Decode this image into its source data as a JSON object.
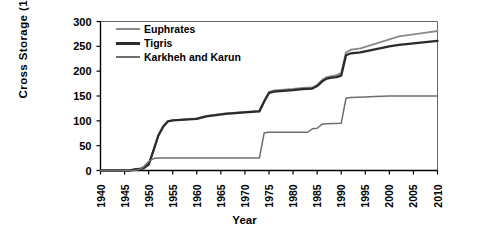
{
  "chart_data": {
    "type": "line",
    "title": "",
    "xlabel": "Year",
    "ylabel": "Cross Storage (10⁹ m³)",
    "ylabel_text": "Cross  Storage  (10",
    "ylabel_exp": "9",
    "ylabel_tail": " m",
    "ylabel_exp2": "3",
    "ylabel_close": ")",
    "xlim": [
      1940,
      2010
    ],
    "ylim": [
      0,
      300
    ],
    "grid": false,
    "legend_position": "top-left",
    "xticks": [
      1940,
      1945,
      1950,
      1955,
      1960,
      1965,
      1970,
      1975,
      1980,
      1985,
      1990,
      1995,
      2000,
      2005,
      2010
    ],
    "yticks": [
      0,
      50,
      100,
      150,
      200,
      250,
      300
    ],
    "colors": {
      "euphrates": "#8a8a8a",
      "tigris": "#2b2b2b",
      "karkheh": "#6e6e6e",
      "axis": "#000000"
    },
    "series": [
      {
        "name": "Euphrates",
        "color": "#8a8a8a",
        "width": 1.9,
        "points": [
          [
            1940,
            0
          ],
          [
            1946,
            0
          ],
          [
            1947,
            2
          ],
          [
            1948,
            3
          ],
          [
            1949,
            5
          ],
          [
            1950,
            12
          ],
          [
            1951,
            40
          ],
          [
            1952,
            70
          ],
          [
            1953,
            88
          ],
          [
            1954,
            99
          ],
          [
            1955,
            101
          ],
          [
            1960,
            105
          ],
          [
            1962,
            110
          ],
          [
            1966,
            115
          ],
          [
            1970,
            118
          ],
          [
            1973,
            120
          ],
          [
            1974,
            140
          ],
          [
            1975,
            158
          ],
          [
            1976,
            161
          ],
          [
            1980,
            164
          ],
          [
            1982,
            166
          ],
          [
            1984,
            167
          ],
          [
            1985,
            172
          ],
          [
            1986,
            182
          ],
          [
            1987,
            188
          ],
          [
            1988,
            190
          ],
          [
            1989,
            192
          ],
          [
            1990,
            196
          ],
          [
            1991,
            238
          ],
          [
            1992,
            243
          ],
          [
            1994,
            246
          ],
          [
            1996,
            252
          ],
          [
            1998,
            258
          ],
          [
            2000,
            264
          ],
          [
            2002,
            270
          ],
          [
            2005,
            274
          ],
          [
            2008,
            278
          ],
          [
            2010,
            281
          ]
        ]
      },
      {
        "name": "Tigris",
        "color": "#2b2b2b",
        "width": 2.3,
        "points": [
          [
            1940,
            0
          ],
          [
            1946,
            0
          ],
          [
            1947,
            2
          ],
          [
            1948,
            3
          ],
          [
            1949,
            5
          ],
          [
            1950,
            12
          ],
          [
            1951,
            40
          ],
          [
            1952,
            70
          ],
          [
            1953,
            88
          ],
          [
            1954,
            99
          ],
          [
            1955,
            101
          ],
          [
            1960,
            104
          ],
          [
            1962,
            109
          ],
          [
            1966,
            114
          ],
          [
            1970,
            117
          ],
          [
            1973,
            119
          ],
          [
            1974,
            139
          ],
          [
            1975,
            156
          ],
          [
            1976,
            159
          ],
          [
            1980,
            162
          ],
          [
            1982,
            164
          ],
          [
            1984,
            165
          ],
          [
            1985,
            170
          ],
          [
            1986,
            179
          ],
          [
            1987,
            185
          ],
          [
            1988,
            187
          ],
          [
            1989,
            188
          ],
          [
            1990,
            191
          ],
          [
            1991,
            232
          ],
          [
            1992,
            236
          ],
          [
            1994,
            238
          ],
          [
            1996,
            242
          ],
          [
            1998,
            246
          ],
          [
            2000,
            250
          ],
          [
            2002,
            253
          ],
          [
            2005,
            256
          ],
          [
            2008,
            259
          ],
          [
            2010,
            261
          ]
        ]
      },
      {
        "name": "Karkheh and Karun",
        "color": "#6e6e6e",
        "width": 1.5,
        "points": [
          [
            1940,
            0
          ],
          [
            1947,
            0
          ],
          [
            1948,
            2
          ],
          [
            1949,
            8
          ],
          [
            1950,
            18
          ],
          [
            1951,
            24
          ],
          [
            1952,
            25
          ],
          [
            1973,
            25
          ],
          [
            1974,
            76
          ],
          [
            1975,
            77
          ],
          [
            1983,
            77
          ],
          [
            1984,
            84
          ],
          [
            1985,
            85
          ],
          [
            1986,
            93
          ],
          [
            1987,
            94
          ],
          [
            1990,
            95
          ],
          [
            1991,
            146
          ],
          [
            1992,
            147
          ],
          [
            1995,
            148
          ],
          [
            1997,
            149
          ],
          [
            2000,
            150
          ],
          [
            2005,
            150
          ],
          [
            2010,
            150
          ]
        ]
      }
    ],
    "legend": [
      {
        "label": "Euphrates",
        "color": "#8a8a8a",
        "width": 2
      },
      {
        "label": "Tigris",
        "color": "#2b2b2b",
        "width": 3
      },
      {
        "label": "Karkheh and Karun",
        "color": "#6e6e6e",
        "width": 2
      }
    ]
  }
}
